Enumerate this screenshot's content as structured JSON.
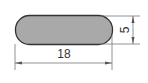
{
  "diagram": {
    "type": "technical-drawing",
    "shape": "rounded-bar-cross-section",
    "fill_color": "#a9a9a9",
    "stroke_color": "#333333",
    "dimensions": {
      "width": {
        "label": "18",
        "orientation": "horizontal"
      },
      "height": {
        "label": "5",
        "orientation": "vertical"
      }
    }
  }
}
